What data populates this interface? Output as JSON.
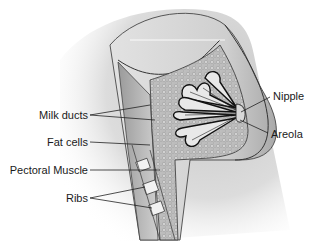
{
  "diagram": {
    "labels": [
      {
        "id": "milk-ducts",
        "text": "Milk ducts",
        "side": "left"
      },
      {
        "id": "fat-cells",
        "text": "Fat cells",
        "side": "left"
      },
      {
        "id": "pectoral-muscle",
        "text": "Pectoral Muscle",
        "side": "left"
      },
      {
        "id": "ribs",
        "text": "Ribs",
        "side": "left"
      },
      {
        "id": "nipple",
        "text": "Nipple",
        "side": "right"
      },
      {
        "id": "areola",
        "text": "Areola",
        "side": "right"
      }
    ],
    "colors": {
      "line": "#222222",
      "skin_shade": "#c8c8c8",
      "tissue": "#b5b5b5",
      "background": "#ffffff"
    }
  }
}
